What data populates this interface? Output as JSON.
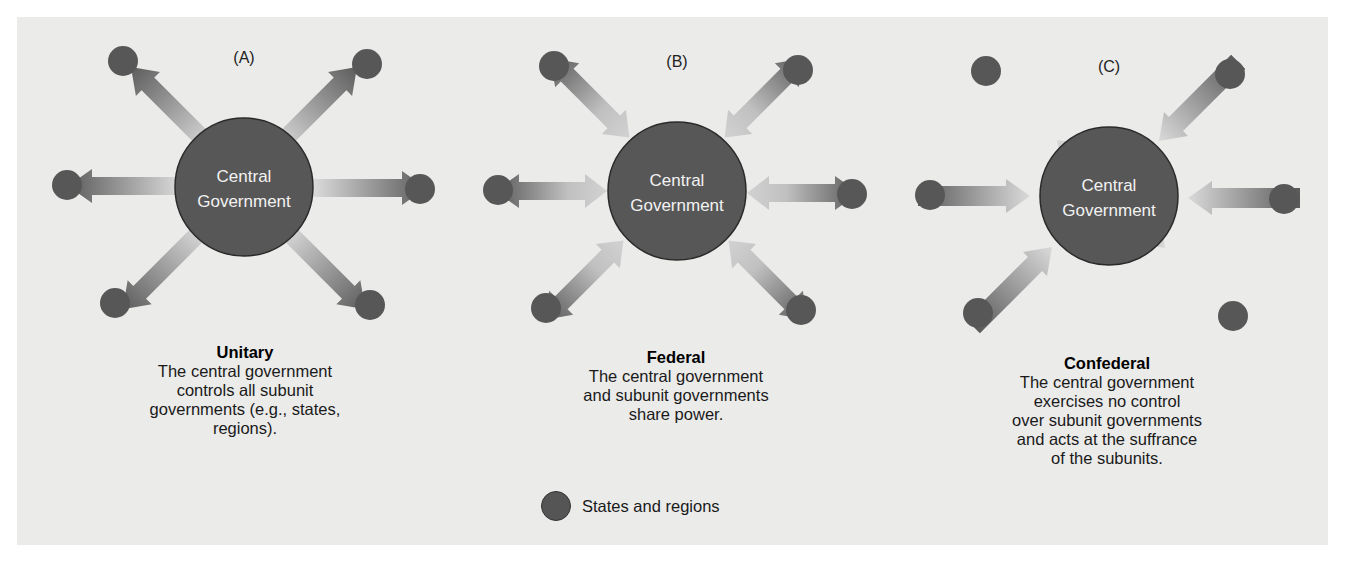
{
  "colors": {
    "background": "#ebebea",
    "node_fill": "#575757",
    "node_stroke": "#2a2a2a",
    "arrow_dark": "#5e5e5e",
    "arrow_light": "#d6d6d6",
    "center_text": "#f2f2f2"
  },
  "diagrams": [
    {
      "letter": "(A)",
      "center_label_line1": "Central",
      "center_label_line2": "Government",
      "arrow_direction": "outward",
      "title": "Unitary",
      "description": "The central government\ncontrols all subunit\ngovernments (e.g., states,\nregions)."
    },
    {
      "letter": "(B)",
      "center_label_line1": "Central",
      "center_label_line2": "Government",
      "arrow_direction": "bidirectional",
      "title": "Federal",
      "description": "The central government\nand subunit governments\nshare power."
    },
    {
      "letter": "(C)",
      "center_label_line1": "Central",
      "center_label_line2": "Government",
      "arrow_direction": "inward",
      "title": "Confederal",
      "description": "The central government\nexercises no control\nover subunit governments\nand acts at the suffrance\nof the subunits."
    }
  ],
  "legend": {
    "icon": "filled-circle",
    "label": "States and regions"
  }
}
